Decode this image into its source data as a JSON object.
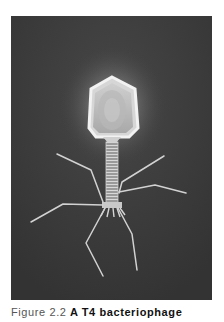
{
  "figure": {
    "number_label": "Figure 2.2",
    "title": "A T4 bacteriophage",
    "image_subject": "T4 bacteriophage (head, tail sheath, baseplate, tail fibers)",
    "colors": {
      "background": "#3b3b3b",
      "specimen_highlight": "#e8e8e8",
      "glow": "#ffffff"
    }
  }
}
